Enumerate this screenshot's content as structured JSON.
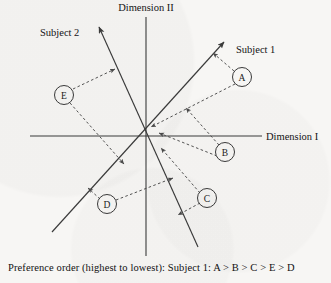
{
  "figure": {
    "type": "vector-preference-map",
    "background_color": "#f7f6f4",
    "line_color": "#3b3b3b",
    "axes": {
      "origin": {
        "x": 146,
        "y": 136
      },
      "horizontal": {
        "label": "Dimension I",
        "x1": 30,
        "y1": 136,
        "x2": 262,
        "y2": 136,
        "label_x": 266,
        "label_y": 139
      },
      "vertical": {
        "label": "Dimension II",
        "x1": 146,
        "y1": 17,
        "x2": 146,
        "y2": 256,
        "label_x": 146,
        "label_y": 11
      }
    },
    "vectors": [
      {
        "name": "Subject 1",
        "label": "Subject 1",
        "x1": 52,
        "y1": 232,
        "x2": 224,
        "y2": 42,
        "arrow_at": "end",
        "label_x": 236,
        "label_y": 53
      },
      {
        "name": "Subject 2",
        "label": "Subject 2",
        "x1": 198,
        "y1": 247,
        "x2": 99,
        "y2": 27,
        "arrow_at": "end",
        "label_x": 40,
        "label_y": 36
      }
    ],
    "points": [
      {
        "id": "A",
        "label": "A",
        "cx": 242,
        "cy": 77,
        "r": 9.5
      },
      {
        "id": "B",
        "label": "B",
        "cx": 225,
        "cy": 152,
        "r": 9.5
      },
      {
        "id": "C",
        "label": "C",
        "cx": 207,
        "cy": 198,
        "r": 9.5
      },
      {
        "id": "D",
        "label": "D",
        "cx": 107,
        "cy": 204,
        "r": 9.5
      },
      {
        "id": "E",
        "label": "E",
        "cx": 64,
        "cy": 95,
        "r": 9.5
      }
    ],
    "projections": [
      {
        "point": "A",
        "onto": "Subject 1",
        "x1": 234,
        "y1": 71,
        "x2": 213,
        "y2": 53
      },
      {
        "point": "A",
        "onto": "Subject 2",
        "x1": 235,
        "y1": 84,
        "x2": 151,
        "y2": 127
      },
      {
        "point": "B",
        "onto": "Subject 1",
        "x1": 219,
        "y1": 145,
        "x2": 186,
        "y2": 108
      },
      {
        "point": "B",
        "onto": "Subject 2",
        "x1": 217,
        "y1": 156,
        "x2": 159,
        "y2": 133
      },
      {
        "point": "C",
        "onto": "Subject 1",
        "x1": 200,
        "y1": 193,
        "x2": 161,
        "y2": 148
      },
      {
        "point": "C",
        "onto": "Subject 2",
        "x1": 200,
        "y1": 203,
        "x2": 178,
        "y2": 215
      },
      {
        "point": "D",
        "onto": "Subject 1",
        "x1": 100,
        "y1": 199,
        "x2": 88,
        "y2": 188
      },
      {
        "point": "D",
        "onto": "Subject 2",
        "x1": 116,
        "y1": 200,
        "x2": 173,
        "y2": 178
      },
      {
        "point": "E",
        "onto": "Subject 2",
        "x1": 73,
        "y1": 89,
        "x2": 115,
        "y2": 69
      },
      {
        "point": "E",
        "onto": "Subject 1",
        "x1": 70,
        "y1": 103,
        "x2": 124,
        "y2": 164
      }
    ]
  },
  "caption": {
    "text": "Preference order (highest to lowest): Subject 1: A > B > C > E > D"
  }
}
